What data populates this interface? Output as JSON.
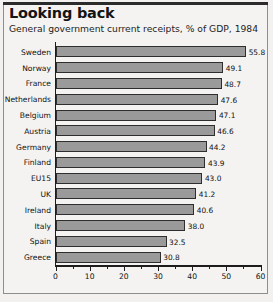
{
  "figure": {
    "title": "Looking back",
    "subtitle": "General government current receipts, % of GDP, 1984"
  },
  "chart_data": {
    "type": "bar",
    "orientation": "horizontal",
    "title": "Looking back",
    "subtitle": "General government current receipts, % of GDP, 1984",
    "xlabel": "",
    "ylabel": "",
    "xlim": [
      0,
      60
    ],
    "grid": false,
    "legend": null,
    "major_ticks": [
      0,
      10,
      20,
      30,
      40,
      50,
      60
    ],
    "minor_ticks": [
      5,
      15,
      25,
      35,
      45,
      55
    ],
    "tick_labels": [
      "0",
      "10",
      "20",
      "30",
      "40",
      "50",
      "60"
    ],
    "categories": [
      "Sweden",
      "Norway",
      "France",
      "Netherlands",
      "Belgium",
      "Austria",
      "Germany",
      "Finland",
      "EU15",
      "UK",
      "Ireland",
      "Italy",
      "Spain",
      "Greece"
    ],
    "values": [
      55.8,
      49.1,
      48.7,
      47.6,
      47.1,
      46.6,
      44.2,
      43.9,
      43.0,
      41.2,
      40.6,
      38.0,
      32.5,
      30.8
    ],
    "value_labels": [
      "55.8",
      "49.1",
      "48.7",
      "47.6",
      "47.1",
      "46.6",
      "44.2",
      "43.9",
      "43.0",
      "41.2",
      "40.6",
      "38.0",
      "32.5",
      "30.8"
    ],
    "bar_color": "#9a9a9a",
    "bar_edge_color": "#2e2e2e",
    "axis_color": "#1c1c1c",
    "background_color": "#f4f3f1"
  }
}
